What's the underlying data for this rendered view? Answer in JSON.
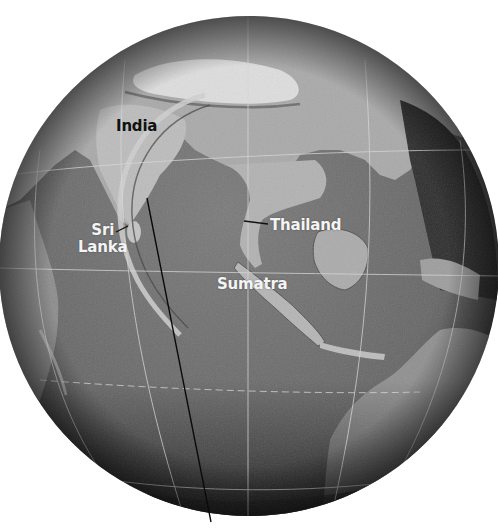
{
  "map": {
    "projection": "orthographic-globe",
    "style": "grayscale relief",
    "globe": {
      "cx": 249,
      "cy": 266,
      "r": 250
    },
    "colors": {
      "ocean": "#6e6e6e",
      "ocean_dark": "#2a2a2a",
      "land": "#a8a8a8",
      "land_light": "#cfcfcf",
      "mountain_snow": "#e6e6e6",
      "graticule": "#d8d8d8",
      "track_line": "#0a0a0a",
      "wave_front": "#c9c9c9"
    },
    "labels": [
      {
        "id": "india",
        "text": "India",
        "x": 116,
        "y": 118,
        "tone": "dark"
      },
      {
        "id": "sri-lanka",
        "lines": [
          "Sri",
          "Lanka"
        ],
        "x": 78,
        "y": 222,
        "tone": "light"
      },
      {
        "id": "thailand",
        "text": "Thailand",
        "x": 270,
        "y": 217,
        "tone": "light"
      },
      {
        "id": "sumatra",
        "text": "Sumatra",
        "x": 217,
        "y": 276,
        "tone": "light"
      }
    ],
    "leader_lines": [
      {
        "for": "sri-lanka",
        "x1": 116,
        "y1": 232,
        "x2": 128,
        "y2": 226
      },
      {
        "for": "thailand",
        "x1": 244,
        "y1": 221,
        "x2": 268,
        "y2": 224
      }
    ],
    "track_line": {
      "x1": 147,
      "y1": 198,
      "x2": 211,
      "y2": 522
    },
    "wave_front": {
      "description": "tsunami wave crest arc west of Sumatra"
    }
  }
}
